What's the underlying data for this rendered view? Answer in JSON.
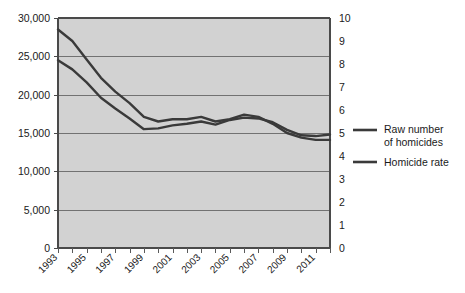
{
  "chart_data": {
    "type": "line",
    "title": "",
    "xlabel": "",
    "ylabel": "",
    "grid": true,
    "legend_position": "right",
    "x": [
      1993,
      1994,
      1995,
      1996,
      1997,
      1998,
      1999,
      2000,
      2001,
      2002,
      2003,
      2004,
      2005,
      2006,
      2007,
      2008,
      2009,
      2010,
      2011,
      2012
    ],
    "xlim": [
      1993,
      2012
    ],
    "xtick_labels": [
      "1993",
      "1995",
      "1997",
      "1999",
      "2001",
      "2003",
      "2005",
      "2007",
      "2009",
      "2011"
    ],
    "xtick_values": [
      1993,
      1995,
      1997,
      1999,
      2001,
      2003,
      2005,
      2007,
      2009,
      2011
    ],
    "xtick_all_values": [
      1993,
      1994,
      1995,
      1996,
      1997,
      1998,
      1999,
      2000,
      2001,
      2002,
      2003,
      2004,
      2005,
      2006,
      2007,
      2008,
      2009,
      2010,
      2011,
      2012
    ],
    "left_axis": {
      "name": "Raw number of homicides",
      "ylim": [
        0,
        30000
      ],
      "tick_values": [
        0,
        5000,
        10000,
        15000,
        20000,
        25000,
        30000
      ],
      "tick_labels": [
        "0",
        "5,000",
        "10,000",
        "15,000",
        "20,000",
        "25,000",
        "30,000"
      ]
    },
    "right_axis": {
      "name": "Homicide rate",
      "ylim": [
        0,
        10
      ],
      "tick_values": [
        0,
        1,
        2,
        3,
        4,
        5,
        6,
        7,
        8,
        9,
        10
      ],
      "tick_labels": [
        "0",
        "1",
        "2",
        "3",
        "4",
        "5",
        "6",
        "7",
        "8",
        "9",
        "10"
      ]
    },
    "series": [
      {
        "name": "Raw number of homicides",
        "axis": "left",
        "color": "#3a3a3a",
        "values": [
          24500,
          23300,
          21600,
          19600,
          18200,
          16900,
          15500,
          15600,
          16000,
          16200,
          16500,
          16100,
          16700,
          17000,
          16900,
          16400,
          15400,
          14700,
          14600,
          14800
        ]
      },
      {
        "name": "Homicide rate",
        "axis": "right",
        "color": "#3a3a3a",
        "values": [
          9.5,
          9.0,
          8.2,
          7.4,
          6.8,
          6.3,
          5.7,
          5.5,
          5.6,
          5.6,
          5.7,
          5.5,
          5.6,
          5.8,
          5.7,
          5.4,
          5.0,
          4.8,
          4.7,
          4.7
        ]
      }
    ]
  },
  "legend": {
    "entries": [
      {
        "label_line1": "Raw number",
        "label_line2": "of homicides"
      },
      {
        "label_line1": "Homicide rate",
        "label_line2": ""
      }
    ]
  },
  "colors": {
    "plot_background": "#d2d2d2",
    "gridline": "#5a5a5a",
    "series": "#3a3a3a",
    "text": "#1a1a1a",
    "page_background": "#ffffff"
  }
}
